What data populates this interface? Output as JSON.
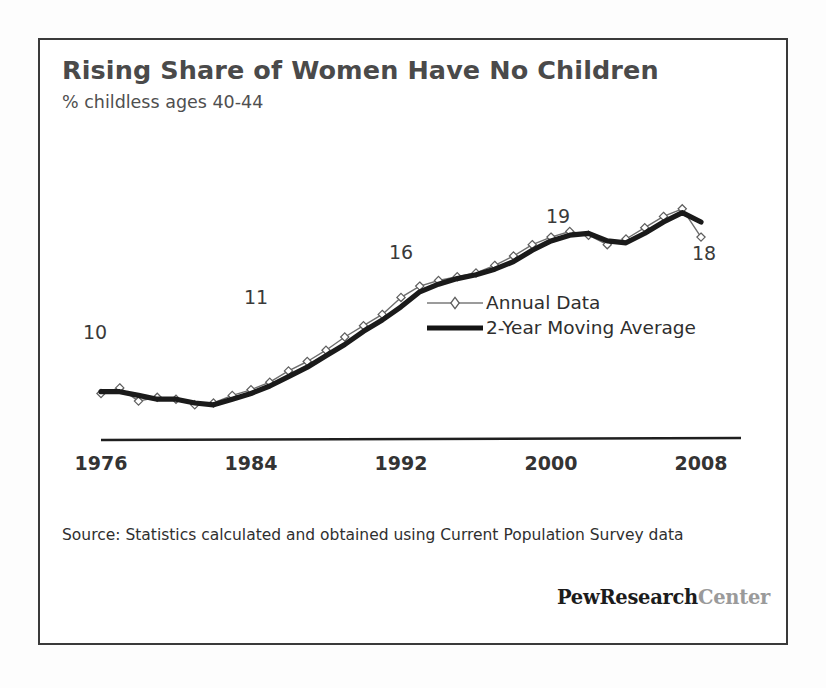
{
  "chart_data": {
    "type": "line",
    "title": "Rising Share of Women Have No Children",
    "subtitle": "% childless  ages 40-44",
    "xlabel": "",
    "ylabel": "",
    "xlim": [
      1976,
      2008
    ],
    "ylim": [
      8,
      21
    ],
    "grid": false,
    "legend_position": "center-right-inside",
    "x": [
      1976,
      1977,
      1978,
      1979,
      1980,
      1981,
      1982,
      1983,
      1984,
      1985,
      1986,
      1987,
      1988,
      1989,
      1990,
      1991,
      1992,
      1993,
      1994,
      1995,
      1996,
      1997,
      1998,
      1999,
      2000,
      2001,
      2002,
      2003,
      2004,
      2005,
      2006,
      2007,
      2008
    ],
    "tick_labels": [
      "1976",
      "1984",
      "1992",
      "2000",
      "2008"
    ],
    "tick_values": [
      1976,
      1984,
      1992,
      2000,
      2008
    ],
    "series": [
      {
        "name": "Annual Data",
        "style": "thin-line-diamond-markers",
        "color": "#6e6e6e",
        "values": [
          10.2,
          10.5,
          9.8,
          10.0,
          9.9,
          9.6,
          9.7,
          10.1,
          10.4,
          10.8,
          11.4,
          11.9,
          12.5,
          13.2,
          13.8,
          14.4,
          15.3,
          15.9,
          16.2,
          16.4,
          16.6,
          17.0,
          17.5,
          18.1,
          18.5,
          18.8,
          18.6,
          18.1,
          18.4,
          19.0,
          19.6,
          20.0,
          18.5
        ]
      },
      {
        "name": "2-Year Moving Average",
        "style": "thick-solid-line",
        "color": "#1a1a1a",
        "values": [
          10.3,
          10.3,
          10.1,
          9.9,
          9.9,
          9.7,
          9.6,
          9.9,
          10.2,
          10.6,
          11.1,
          11.6,
          12.2,
          12.8,
          13.5,
          14.1,
          14.8,
          15.6,
          16.0,
          16.3,
          16.5,
          16.8,
          17.2,
          17.8,
          18.3,
          18.6,
          18.7,
          18.3,
          18.2,
          18.7,
          19.3,
          19.8,
          19.3
        ]
      }
    ],
    "annotations": [
      {
        "label": "10",
        "x": 1976,
        "y": 10.2
      },
      {
        "label": "11",
        "x": 1984,
        "y": 10.4
      },
      {
        "label": "16",
        "x": 1992,
        "y": 15.3
      },
      {
        "label": "19",
        "x": 2000,
        "y": 18.5
      },
      {
        "label": "18",
        "x": 2008,
        "y": 18.5
      }
    ]
  },
  "legend": {
    "items": [
      {
        "label": "Annual Data"
      },
      {
        "label": "2-Year Moving Average"
      }
    ]
  },
  "footer": {
    "source": "Source: Statistics calculated and obtained using Current Population Survey data",
    "brand_primary": "PewResearch",
    "brand_secondary": "Center"
  }
}
